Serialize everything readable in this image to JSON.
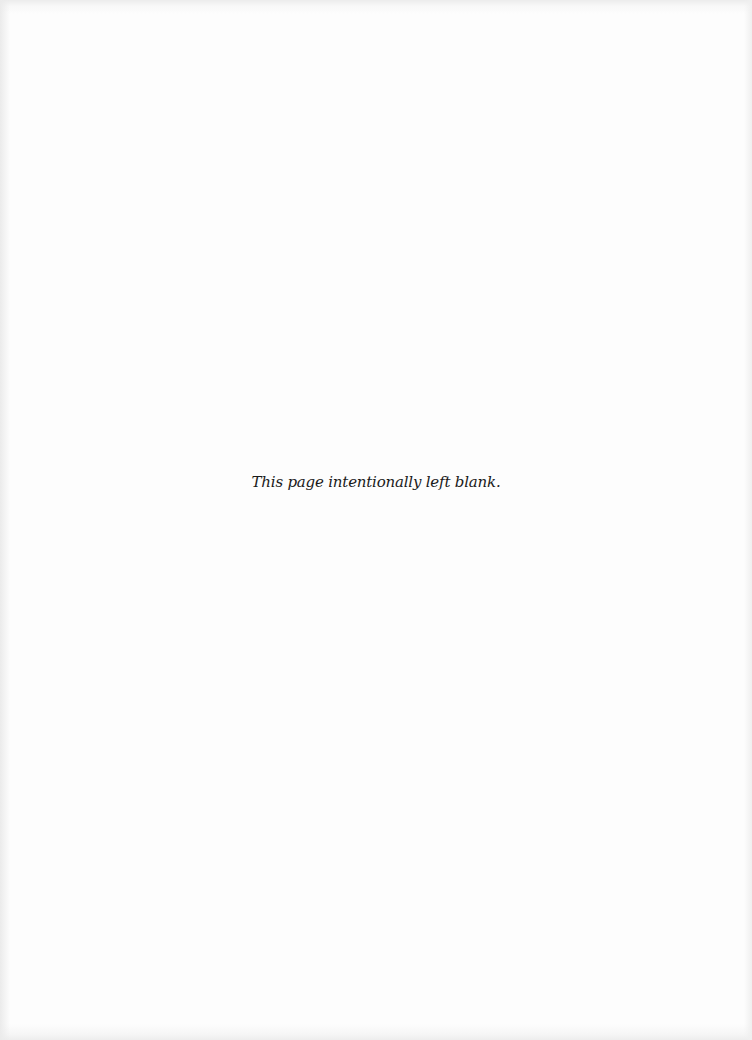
{
  "page": {
    "notice_text": "This page intentionally left blank."
  }
}
